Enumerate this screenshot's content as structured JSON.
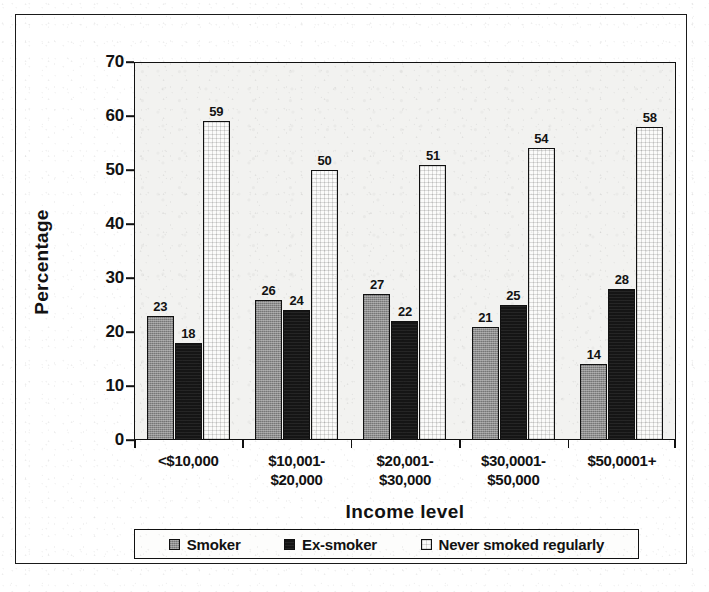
{
  "chart_data": {
    "type": "bar",
    "title": "",
    "xlabel": "Income level",
    "ylabel": "Percentage",
    "ylim": [
      0,
      70
    ],
    "ytick_step": 10,
    "yticks": [
      0,
      10,
      20,
      30,
      40,
      50,
      60,
      70
    ],
    "grid": false,
    "legend_position": "bottom",
    "value_labels": true,
    "categories": [
      "<$10,000",
      "$10,001-\n$20,000",
      "$20,001-\n$30,000",
      "$30,0001-\n$50,000",
      "$50,0001+"
    ],
    "category_lines": [
      [
        "<$10,000",
        ""
      ],
      [
        "$10,001-",
        "$20,000"
      ],
      [
        "$20,001-",
        "$30,000"
      ],
      [
        "$30,0001-",
        "$50,000"
      ],
      [
        "$50,0001+",
        ""
      ]
    ],
    "series": [
      {
        "name": "Smoker",
        "values": [
          23,
          26,
          27,
          21,
          14
        ],
        "color": "#8d8d8d",
        "pattern": "gray-fine-hatch"
      },
      {
        "name": "Ex-smoker",
        "values": [
          18,
          24,
          22,
          25,
          28
        ],
        "color": "#151515",
        "pattern": "solid-black"
      },
      {
        "name": "Never smoked regularly",
        "values": [
          59,
          50,
          51,
          54,
          58
        ],
        "color": "#fbfbfa",
        "pattern": "white-grid"
      }
    ]
  },
  "axes": {
    "y_title": "Percentage",
    "x_title": "Income level",
    "y_tick_labels": [
      "70",
      "60",
      "50",
      "40",
      "30",
      "20",
      "10",
      "0"
    ]
  },
  "legend": {
    "items": [
      {
        "label": "Smoker"
      },
      {
        "label": "Ex-smoker"
      },
      {
        "label": "Never smoked regularly"
      }
    ]
  }
}
